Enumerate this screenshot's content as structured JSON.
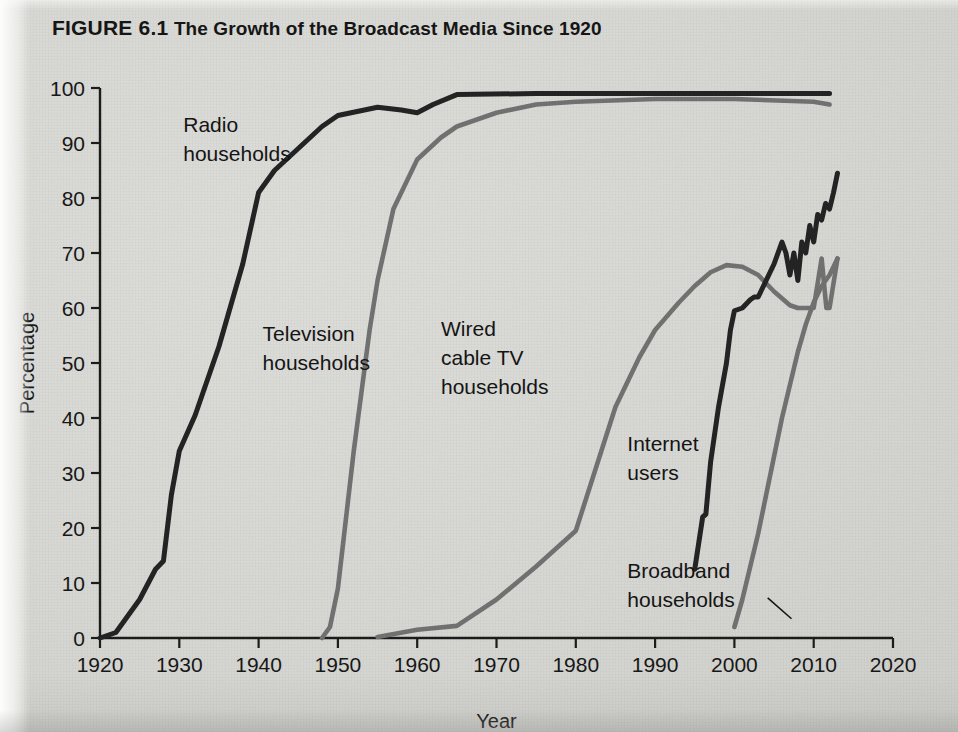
{
  "figure": {
    "label": "FIGURE 6.1",
    "caption": "The Growth of the Broadcast Media Since 1920",
    "full_title": "FIGURE 6.1 The Growth of the Broadcast Media Since 1920"
  },
  "colors": {
    "background": "#d8d8d5",
    "dark_series": "#222222",
    "gray_series": "#707070",
    "axis": "#1a1a1a",
    "text": "#141414"
  },
  "chart_data": {
    "type": "line",
    "title": "The Growth of the Broadcast Media Since 1920",
    "xlabel": "Year",
    "ylabel": "Percentage",
    "xlim": [
      1920,
      2020
    ],
    "ylim": [
      0,
      100
    ],
    "grid": false,
    "legend": "inline-labels",
    "xticks": [
      1920,
      1930,
      1940,
      1950,
      1960,
      1970,
      1980,
      1990,
      2000,
      2010,
      2020
    ],
    "yticks": [
      0,
      10,
      20,
      30,
      40,
      50,
      60,
      70,
      80,
      90,
      100
    ],
    "series": [
      {
        "name": "Radio households",
        "color": "#222222",
        "label_lines": [
          "Radio",
          "households"
        ],
        "label_x": 1930.5,
        "label_y": 92,
        "points": [
          [
            1920,
            0
          ],
          [
            1922,
            1
          ],
          [
            1925,
            7
          ],
          [
            1927,
            12.5
          ],
          [
            1928,
            14
          ],
          [
            1929,
            26
          ],
          [
            1930,
            34
          ],
          [
            1932,
            40.5
          ],
          [
            1935,
            53
          ],
          [
            1938,
            68
          ],
          [
            1940,
            81
          ],
          [
            1942,
            85
          ],
          [
            1945,
            89
          ],
          [
            1948,
            93
          ],
          [
            1950,
            95
          ],
          [
            1955,
            96.5
          ],
          [
            1958,
            96
          ],
          [
            1960,
            95.5
          ],
          [
            1962,
            97
          ],
          [
            1965,
            98.8
          ],
          [
            1975,
            99
          ],
          [
            1985,
            99
          ],
          [
            1995,
            99
          ],
          [
            2005,
            99
          ],
          [
            2012,
            99
          ]
        ]
      },
      {
        "name": "Television households",
        "color": "#707070",
        "label_lines": [
          "Television",
          "households"
        ],
        "label_x": 1940.5,
        "label_y": 54,
        "points": [
          [
            1948,
            0
          ],
          [
            1949,
            2
          ],
          [
            1950,
            9
          ],
          [
            1952,
            34
          ],
          [
            1954,
            56
          ],
          [
            1955,
            65
          ],
          [
            1957,
            78
          ],
          [
            1960,
            87
          ],
          [
            1963,
            91
          ],
          [
            1965,
            93
          ],
          [
            1970,
            95.5
          ],
          [
            1975,
            97
          ],
          [
            1980,
            97.5
          ],
          [
            1990,
            98
          ],
          [
            2000,
            98
          ],
          [
            2010,
            97.5
          ],
          [
            2012,
            97
          ]
        ]
      },
      {
        "name": "Wired cable TV households",
        "color": "#707070",
        "label_lines": [
          "Wired",
          "cable TV",
          "households"
        ],
        "label_x": 1963,
        "label_y": 55,
        "points": [
          [
            1955,
            0.2
          ],
          [
            1960,
            1.5
          ],
          [
            1965,
            2.2
          ],
          [
            1970,
            7
          ],
          [
            1975,
            13
          ],
          [
            1980,
            19.5
          ],
          [
            1983,
            33
          ],
          [
            1985,
            42
          ],
          [
            1988,
            51
          ],
          [
            1990,
            56
          ],
          [
            1993,
            61
          ],
          [
            1995,
            64
          ],
          [
            1997,
            66.5
          ],
          [
            1999,
            67.8
          ],
          [
            2001,
            67.5
          ],
          [
            2003,
            66
          ],
          [
            2005,
            63
          ],
          [
            2007,
            60.5
          ],
          [
            2008,
            60
          ],
          [
            2009,
            60
          ],
          [
            2010,
            60
          ],
          [
            2011,
            69
          ],
          [
            2011.6,
            60
          ],
          [
            2012,
            60
          ],
          [
            2013,
            69
          ]
        ]
      },
      {
        "name": "Internet users",
        "color": "#222222",
        "label_lines": [
          "Internet",
          "users"
        ],
        "label_x": 1986.5,
        "label_y": 34,
        "points": [
          [
            1995,
            12.5
          ],
          [
            1996,
            22
          ],
          [
            1996.4,
            22.5
          ],
          [
            1997,
            32
          ],
          [
            1998,
            42
          ],
          [
            1999,
            50
          ],
          [
            1999.5,
            56
          ],
          [
            2000,
            59.5
          ],
          [
            2001,
            60
          ],
          [
            2002,
            61.5
          ],
          [
            2002.5,
            62
          ],
          [
            2003,
            62
          ],
          [
            2004,
            65
          ],
          [
            2005,
            68
          ],
          [
            2006,
            72
          ],
          [
            2006.5,
            70
          ],
          [
            2007,
            66
          ],
          [
            2007.5,
            70
          ],
          [
            2008,
            65
          ],
          [
            2008.5,
            72
          ],
          [
            2009,
            70
          ],
          [
            2009.5,
            75
          ],
          [
            2010,
            72
          ],
          [
            2010.5,
            77
          ],
          [
            2011,
            76
          ],
          [
            2011.5,
            79
          ],
          [
            2012,
            78
          ],
          [
            2012.5,
            81
          ],
          [
            2013,
            84.5
          ]
        ]
      },
      {
        "name": "Broadband households",
        "color": "#707070",
        "label_lines": [
          "Broadband",
          "households"
        ],
        "label_x": 1986.5,
        "label_y": 11,
        "points": [
          [
            2000,
            2
          ],
          [
            2001,
            7
          ],
          [
            2002,
            13
          ],
          [
            2003,
            19
          ],
          [
            2004,
            26
          ],
          [
            2005,
            33
          ],
          [
            2006,
            40
          ],
          [
            2007,
            46
          ],
          [
            2008,
            52
          ],
          [
            2009,
            57
          ],
          [
            2010,
            61
          ],
          [
            2011,
            64
          ],
          [
            2012,
            66
          ],
          [
            2013,
            69
          ]
        ]
      }
    ],
    "annotations": [
      {
        "name": "broadband-leader-line",
        "from": [
          2004.2,
          7.3
        ],
        "to": [
          2007.2,
          3.5
        ]
      }
    ]
  }
}
